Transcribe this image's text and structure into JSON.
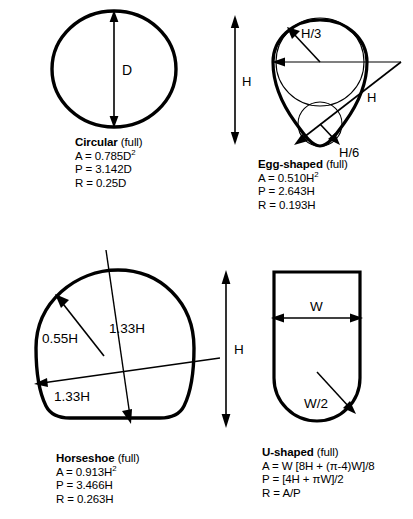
{
  "diagram": {
    "stroke_color": "#000000",
    "thin_stroke_color": "#000000",
    "background_color": "#ffffff"
  },
  "figures": [
    {
      "key": "circular",
      "name": "Circular",
      "suffix": " (full)",
      "dimension_labels": [
        "D"
      ],
      "formulas": [
        {
          "symbol": "A",
          "expression": "A = 0.785D",
          "superscript": "2"
        },
        {
          "symbol": "P",
          "expression": "P = 3.142D",
          "superscript": ""
        },
        {
          "symbol": "R",
          "expression": "R = 0.25D",
          "superscript": ""
        }
      ]
    },
    {
      "key": "egg",
      "name": "Egg-shaped",
      "suffix": " (full)",
      "dimension_labels": [
        "H",
        "H/3",
        "H/6",
        "H"
      ],
      "formulas": [
        {
          "symbol": "A",
          "expression": "A = 0.510H",
          "superscript": "2"
        },
        {
          "symbol": "P",
          "expression": "P = 2.643H",
          "superscript": ""
        },
        {
          "symbol": "R",
          "expression": "R = 0.193H",
          "superscript": ""
        }
      ]
    },
    {
      "key": "horseshoe",
      "name": "Horseshoe",
      "suffix": " (full)",
      "dimension_labels": [
        "0.55H",
        "1.33H",
        "1.33H",
        "H"
      ],
      "formulas": [
        {
          "symbol": "A",
          "expression": "A = 0.913H",
          "superscript": "2"
        },
        {
          "symbol": "P",
          "expression": "P = 3.466H",
          "superscript": ""
        },
        {
          "symbol": "R",
          "expression": "R = 0.263H",
          "superscript": ""
        }
      ]
    },
    {
      "key": "ushaped",
      "name": "U-shaped",
      "suffix": " (full)",
      "dimension_labels": [
        "W",
        "W/2"
      ],
      "formulas": [
        {
          "symbol": "A",
          "expression": "A = W [8H + (π-4)W]/8",
          "superscript": ""
        },
        {
          "symbol": "P",
          "expression": "P = [4H + πW]/2",
          "superscript": ""
        },
        {
          "symbol": "R",
          "expression": "R = A/P",
          "superscript": ""
        }
      ]
    }
  ],
  "labels": {
    "circular_D": "D",
    "egg_H_left": "H",
    "egg_H_third": "H/3",
    "egg_H_sixth": "H/6",
    "egg_H_diag": "H",
    "horseshoe_055H": "0.55H",
    "horseshoe_133H_vertical": "1.33H",
    "horseshoe_133H_horizontal": "1.33H",
    "horseshoe_H_right": "H",
    "ushaped_W": "W",
    "ushaped_W2": "W/2"
  }
}
